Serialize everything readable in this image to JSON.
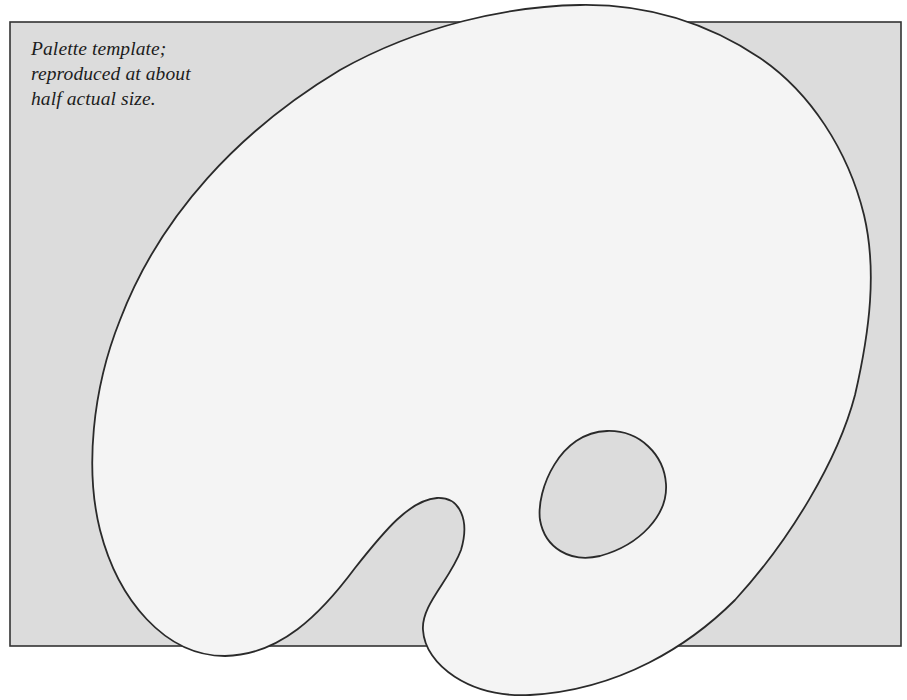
{
  "figure": {
    "caption_lines": [
      "Palette template;",
      "reproduced at about",
      "half actual size."
    ],
    "scale_note": "about half actual size"
  },
  "colors": {
    "background_panel": "#dcdcdc",
    "palette_fill": "#f4f4f4",
    "outline": "#2a2a2a",
    "page": "#ffffff",
    "text": "#1c1c1c"
  },
  "icons": {
    "palette": "palette-outline-icon",
    "thumb_hole": "thumb-hole-icon"
  }
}
